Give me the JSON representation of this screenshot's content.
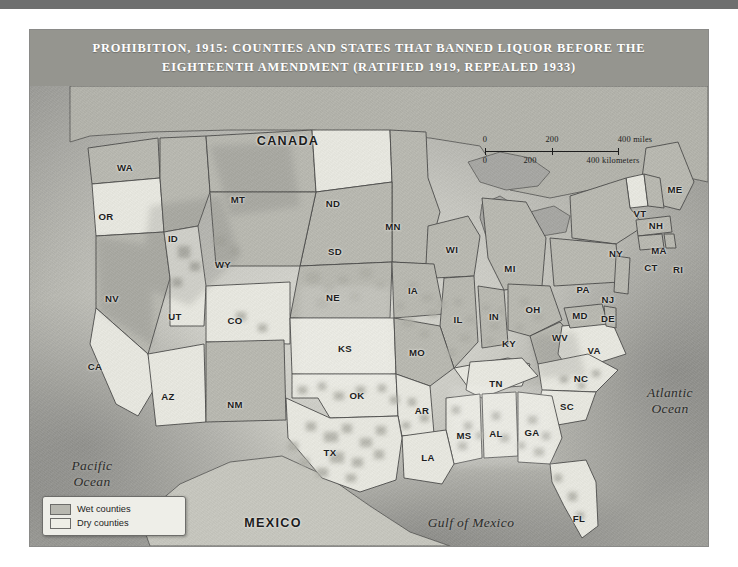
{
  "figure": {
    "title": "PROHIBITION, 1915: COUNTIES AND STATES THAT BANNED LIQUOR BEFORE THE EIGHTEENTH AMENDMENT (RATIFIED 1919, REPEALED 1933)"
  },
  "legend": {
    "items": [
      {
        "label": "Wet counties",
        "swatch": "wet",
        "color": "#b8b8b0"
      },
      {
        "label": "Dry counties",
        "swatch": "dry",
        "color": "#eeeee6"
      }
    ]
  },
  "scale": {
    "miles": {
      "unit": "miles",
      "ticks": [
        "0",
        "200",
        "400"
      ]
    },
    "kilometers": {
      "unit": "kilometers",
      "ticks": [
        "0",
        "200",
        "400"
      ]
    },
    "miles_label": "400 miles",
    "km_label": "400 kilometers"
  },
  "countries": [
    {
      "name": "CANADA",
      "x": 258,
      "y": 55
    },
    {
      "name": "MEXICO",
      "x": 243,
      "y": 437
    }
  ],
  "waters": [
    {
      "name": "Pacific\nOcean",
      "x": 62,
      "y": 388
    },
    {
      "name": "Atlantic\nOcean",
      "x": 640,
      "y": 315
    },
    {
      "name": "Gulf of Mexico",
      "x": 441,
      "y": 437
    }
  ],
  "states": [
    {
      "abbr": "WA",
      "x": 95,
      "y": 81,
      "status": "wet"
    },
    {
      "abbr": "OR",
      "x": 76,
      "y": 130,
      "status": "dry"
    },
    {
      "abbr": "ID",
      "x": 143,
      "y": 152,
      "status": "wet"
    },
    {
      "abbr": "MT",
      "x": 208,
      "y": 113,
      "status": "wet"
    },
    {
      "abbr": "ND",
      "x": 303,
      "y": 117,
      "status": "dry"
    },
    {
      "abbr": "MN",
      "x": 363,
      "y": 140,
      "status": "wet"
    },
    {
      "abbr": "WI",
      "x": 422,
      "y": 163,
      "status": "wet"
    },
    {
      "abbr": "MI",
      "x": 480,
      "y": 182,
      "status": "wet"
    },
    {
      "abbr": "SD",
      "x": 305,
      "y": 165,
      "status": "wet"
    },
    {
      "abbr": "WY",
      "x": 193,
      "y": 178,
      "status": "wet"
    },
    {
      "abbr": "NE",
      "x": 303,
      "y": 211,
      "status": "wet"
    },
    {
      "abbr": "IA",
      "x": 383,
      "y": 204,
      "status": "wet"
    },
    {
      "abbr": "IL",
      "x": 428,
      "y": 233,
      "status": "wet"
    },
    {
      "abbr": "IN",
      "x": 464,
      "y": 230,
      "status": "wet"
    },
    {
      "abbr": "OH",
      "x": 503,
      "y": 223,
      "status": "wet"
    },
    {
      "abbr": "NV",
      "x": 82,
      "y": 212,
      "status": "wet"
    },
    {
      "abbr": "UT",
      "x": 145,
      "y": 230,
      "status": "dry"
    },
    {
      "abbr": "CO",
      "x": 205,
      "y": 234,
      "status": "dry"
    },
    {
      "abbr": "KS",
      "x": 315,
      "y": 262,
      "status": "dry"
    },
    {
      "abbr": "MO",
      "x": 387,
      "y": 266,
      "status": "wet"
    },
    {
      "abbr": "KY",
      "x": 479,
      "y": 257,
      "status": "dry"
    },
    {
      "abbr": "WV",
      "x": 530,
      "y": 251,
      "status": "wet"
    },
    {
      "abbr": "VA",
      "x": 564,
      "y": 264,
      "status": "dry"
    },
    {
      "abbr": "MD",
      "x": 550,
      "y": 229,
      "status": "wet"
    },
    {
      "abbr": "DE",
      "x": 578,
      "y": 232,
      "status": "wet"
    },
    {
      "abbr": "CA",
      "x": 65,
      "y": 280,
      "status": "dry"
    },
    {
      "abbr": "AZ",
      "x": 138,
      "y": 310,
      "status": "dry"
    },
    {
      "abbr": "NM",
      "x": 205,
      "y": 318,
      "status": "wet"
    },
    {
      "abbr": "OK",
      "x": 327,
      "y": 309,
      "status": "dry"
    },
    {
      "abbr": "AR",
      "x": 392,
      "y": 324,
      "status": "dry"
    },
    {
      "abbr": "TN",
      "x": 466,
      "y": 297,
      "status": "dry"
    },
    {
      "abbr": "NC",
      "x": 551,
      "y": 292,
      "status": "dry"
    },
    {
      "abbr": "SC",
      "x": 537,
      "y": 320,
      "status": "dry"
    },
    {
      "abbr": "MS",
      "x": 434,
      "y": 349,
      "status": "dry"
    },
    {
      "abbr": "AL",
      "x": 466,
      "y": 347,
      "status": "dry"
    },
    {
      "abbr": "GA",
      "x": 502,
      "y": 346,
      "status": "dry"
    },
    {
      "abbr": "LA",
      "x": 398,
      "y": 371,
      "status": "dry"
    },
    {
      "abbr": "TX",
      "x": 300,
      "y": 366,
      "status": "dry"
    },
    {
      "abbr": "FL",
      "x": 549,
      "y": 432,
      "status": "dry"
    },
    {
      "abbr": "ME",
      "x": 645,
      "y": 103,
      "status": "wet"
    },
    {
      "abbr": "VT",
      "x": 610,
      "y": 127,
      "status": "dry"
    },
    {
      "abbr": "NH",
      "x": 626,
      "y": 139,
      "status": "wet"
    },
    {
      "abbr": "NY",
      "x": 586,
      "y": 167,
      "status": "wet"
    },
    {
      "abbr": "MA",
      "x": 629,
      "y": 164,
      "status": "wet"
    },
    {
      "abbr": "CT",
      "x": 621,
      "y": 181,
      "status": "wet"
    },
    {
      "abbr": "RI",
      "x": 648,
      "y": 183,
      "status": "wet"
    },
    {
      "abbr": "PA",
      "x": 553,
      "y": 203,
      "status": "wet"
    },
    {
      "abbr": "NJ",
      "x": 578,
      "y": 213,
      "status": "wet"
    }
  ]
}
